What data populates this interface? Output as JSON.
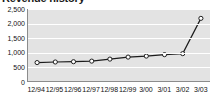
{
  "chart_title": "Revenue history",
  "colors": {
    "plot_background": "#e3e3e3",
    "gridline": "#ffffff",
    "axis": "#8c8c8c",
    "line": "#1c1c1c",
    "marker_fill": "#ffffff",
    "text": "#111111"
  },
  "axes": {
    "y_ticks": [
      "0",
      "500",
      "1,000",
      "1,500",
      "2,000",
      "2,500"
    ],
    "x_ticks": [
      "12/94",
      "12/95",
      "12/96",
      "12/97",
      "12/98",
      "12/99",
      "3/00",
      "3/01",
      "3/02",
      "3/03"
    ]
  },
  "chart_data": {
    "type": "line",
    "title": "Revenue history",
    "xlabel": "",
    "ylabel": "",
    "categories": [
      "12/94",
      "12/95",
      "12/96",
      "12/97",
      "12/98",
      "12/99",
      "3/00",
      "3/01",
      "3/02",
      "3/03"
    ],
    "values": [
      640,
      660,
      670,
      690,
      760,
      830,
      865,
      915,
      950,
      2175
    ],
    "ylim": [
      0,
      2500
    ],
    "ytick_interval": 500,
    "grid": true,
    "legend": false,
    "markers": "open-circle"
  }
}
